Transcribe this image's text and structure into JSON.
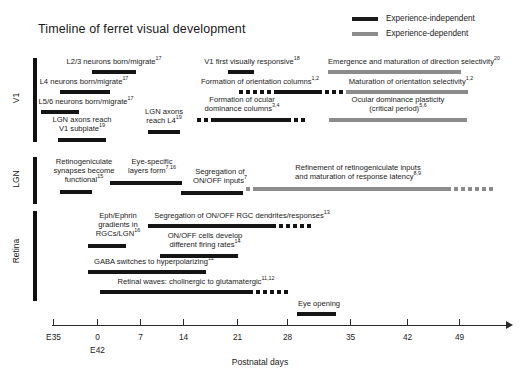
{
  "figure": {
    "title": "Timeline of ferret visual development",
    "axis_title": "Postnatal days",
    "colors": {
      "experience_independent": "#141414",
      "experience_dependent": "#8c8c8c",
      "axis": "#2b2b2b",
      "background": "#ffffff"
    }
  },
  "legend": {
    "items": [
      {
        "label": "Experience-independent",
        "color": "#141414",
        "style": "solid-black"
      },
      {
        "label": "Experience-dependent",
        "color": "#8c8c8c",
        "style": "solid-gray"
      }
    ]
  },
  "sections": [
    {
      "id": "v1",
      "label": "V1"
    },
    {
      "id": "lgn",
      "label": "LGN"
    },
    {
      "id": "retina",
      "label": "Retina"
    }
  ],
  "axis": {
    "ticks": [
      {
        "label": "E35",
        "sublabel": "",
        "x": 53
      },
      {
        "label": "0",
        "sublabel": "E42",
        "x": 97
      },
      {
        "label": "7",
        "sublabel": "",
        "x": 140
      },
      {
        "label": "14",
        "sublabel": "",
        "x": 183
      },
      {
        "label": "21",
        "sublabel": "",
        "x": 237
      },
      {
        "label": "28",
        "sublabel": "",
        "x": 287
      },
      {
        "label": "35",
        "sublabel": "",
        "x": 350
      },
      {
        "label": "42",
        "sublabel": "",
        "x": 407
      },
      {
        "label": "49",
        "sublabel": "",
        "x": 459
      }
    ]
  },
  "events": [
    {
      "section": "v1",
      "name": "l23-neurons-born-migrate",
      "label": "L2/3 neurons born/migrate",
      "ref": "17",
      "label_x": 54,
      "label_y": 58,
      "label_w": 120,
      "bar_x": 92,
      "bar_y": 70,
      "bar_w": 44,
      "type": "experience-independent",
      "dots_start": 0,
      "dots_end": 0
    },
    {
      "section": "v1",
      "name": "v1-first-visually-responsive",
      "label": "V1 first visually responsive",
      "ref": "18",
      "label_x": 190,
      "label_y": 58,
      "label_w": 124,
      "bar_x": 228,
      "bar_y": 70,
      "bar_w": 26,
      "type": "experience-independent",
      "dots_start": 0,
      "dots_end": 0
    },
    {
      "section": "v1",
      "name": "direction-selectivity",
      "label": "Emergence and maturation of direction selectivity",
      "ref": "20",
      "label_x": 308,
      "label_y": 58,
      "label_w": 212,
      "bar_x": 328,
      "bar_y": 70,
      "bar_w": 133,
      "type": "experience-dependent",
      "dots_start": 0,
      "dots_end": 0
    },
    {
      "section": "v1",
      "name": "l4-neurons-born-migrate",
      "label": "L4 neurons born/migrate",
      "ref": "17",
      "label_x": 28,
      "label_y": 78,
      "label_w": 112,
      "bar_x": 60,
      "bar_y": 90,
      "bar_w": 50,
      "type": "experience-independent",
      "dots_start": 0,
      "dots_end": 0
    },
    {
      "section": "v1",
      "name": "formation-orientation-columns",
      "label": "Formation of orientation columns",
      "ref": "1,2",
      "label_x": 190,
      "label_y": 78,
      "label_w": 140,
      "bar_x": 239,
      "bar_y": 90,
      "bar_w": 48,
      "type": "experience-independent",
      "dots_start": 5,
      "dots_end": 4
    },
    {
      "section": "v1",
      "name": "maturation-orientation-selectivity",
      "label": "Maturation of orientation selectivity",
      "ref": "1,2",
      "label_x": 332,
      "label_y": 78,
      "label_w": 158,
      "bar_x": 346,
      "bar_y": 90,
      "bar_w": 122,
      "type": "experience-dependent",
      "dots_start": 0,
      "dots_end": 0
    },
    {
      "section": "v1",
      "name": "l56-neurons-born-migrate",
      "label": "L5/6 neurons born/migrate",
      "ref": "17",
      "label_x": 26,
      "label_y": 98,
      "label_w": 120,
      "bar_x": 41,
      "bar_y": 110,
      "bar_w": 38,
      "type": "experience-independent",
      "dots_start": 0,
      "dots_end": 0
    },
    {
      "section": "v1",
      "name": "formation-ocular-dominance-columns",
      "label": "Formation of ocular",
      "label_line2": "dominance columns",
      "ref": "3,4",
      "label_x": 186,
      "label_y": 96,
      "label_w": 112,
      "bar_x": 197,
      "bar_y": 118,
      "bar_w": 80,
      "type": "experience-independent",
      "dots_start": 2,
      "dots_end": 2
    },
    {
      "section": "v1",
      "name": "ocular-dominance-plasticity",
      "label": "Ocular dominance plasticity",
      "label_line2": "(critical period)",
      "ref": "5,6",
      "label_x": 308,
      "label_y": 96,
      "label_w": 180,
      "bar_x": 329,
      "bar_y": 118,
      "bar_w": 138,
      "type": "experience-dependent",
      "dots_start": 0,
      "dots_end": 0
    },
    {
      "section": "v1",
      "name": "lgn-axons-reach-v1-subplate",
      "label": "LGN axons reach",
      "label_line2": "V1 subplate",
      "ref": "19",
      "label_x": 36,
      "label_y": 116,
      "label_w": 92,
      "bar_x": 58,
      "bar_y": 138,
      "bar_w": 48,
      "type": "experience-independent",
      "dots_start": 0,
      "dots_end": 0
    },
    {
      "section": "v1",
      "name": "lgn-axons-reach-l4",
      "label": "LGN axons",
      "label_line2": "reach L4",
      "ref": "19",
      "label_x": 134,
      "label_y": 108,
      "label_w": 60,
      "bar_x": 148,
      "bar_y": 130,
      "bar_w": 32,
      "type": "experience-independent",
      "dots_start": 0,
      "dots_end": 0
    },
    {
      "section": "lgn",
      "name": "retinogeniculate-synapses-functional",
      "label": "Retinogeniculate",
      "label_line2": "synapses become",
      "label_line3": "functional",
      "ref": "15",
      "label_x": 36,
      "label_y": 158,
      "label_w": 96,
      "bar_x": 60,
      "bar_y": 190,
      "bar_w": 32,
      "type": "experience-independent",
      "dots_start": 0,
      "dots_end": 0
    },
    {
      "section": "lgn",
      "name": "eye-specific-layers-form",
      "label": "Eye-specific",
      "label_line2": "layers form",
      "ref": "7,16",
      "label_x": 112,
      "label_y": 158,
      "label_w": 80,
      "bar_x": 110,
      "bar_y": 181,
      "bar_w": 72,
      "type": "experience-independent",
      "dots_start": 0,
      "dots_end": 0
    },
    {
      "section": "lgn",
      "name": "segregation-onoff-inputs",
      "label": "Segregation of",
      "label_line2": "ON/OFF inputs",
      "ref": "7",
      "label_x": 180,
      "label_y": 168,
      "label_w": 80,
      "bar_x": 181,
      "bar_y": 191,
      "bar_w": 62,
      "type": "experience-independent",
      "dots_start": 0,
      "dots_end": 0
    },
    {
      "section": "lgn",
      "name": "refinement-retinogeniculate-inputs",
      "label": "Refinement of retinogeniculate inputs",
      "label_line2": "and maturation of response latency",
      "ref": "8,9",
      "label_x": 270,
      "label_y": 164,
      "label_w": 176,
      "bar_x": 246,
      "bar_y": 187,
      "bar_w": 198,
      "type": "experience-dependent",
      "dots_start": 1,
      "dots_end": 6
    },
    {
      "section": "retina",
      "name": "eph-ephrin-gradients",
      "label": "Eph/Ephrin",
      "label_line2": "gradients in",
      "label_line3": "RGCs/LGN",
      "ref": "16",
      "label_x": 82,
      "label_y": 212,
      "label_w": 72,
      "bar_x": 88,
      "bar_y": 244,
      "bar_w": 38,
      "type": "experience-independent",
      "dots_start": 0,
      "dots_end": 0
    },
    {
      "section": "retina",
      "name": "segregation-onoff-rgc-dendrites",
      "label": "Segregation of ON/OFF RGC dendrites/responses",
      "ref": "13",
      "label_x": 138,
      "label_y": 212,
      "label_w": 208,
      "bar_x": 148,
      "bar_y": 224,
      "bar_w": 128,
      "type": "experience-independent",
      "dots_start": 0,
      "dots_end": 5
    },
    {
      "section": "retina",
      "name": "onoff-cells-firing-rates",
      "label": "ON/OFF cells develop",
      "label_line2": "different firing rates",
      "ref": "14",
      "label_x": 150,
      "label_y": 232,
      "label_w": 110,
      "bar_x": 160,
      "bar_y": 254,
      "bar_w": 78,
      "type": "experience-independent",
      "dots_start": 0,
      "dots_end": 0
    },
    {
      "section": "retina",
      "name": "gaba-switches-hyperpolarizing",
      "label": "GABA switches to hyperpolarizing",
      "ref": "12",
      "label_x": 78,
      "label_y": 258,
      "label_w": 152,
      "bar_x": 88,
      "bar_y": 270,
      "bar_w": 118,
      "type": "experience-independent",
      "dots_start": 0,
      "dots_end": 0
    },
    {
      "section": "retina",
      "name": "retinal-waves-cholinergic-glutamatergic",
      "label": "Retinal waves: cholinergic to glutamatergic",
      "ref": "11,12",
      "label_x": 100,
      "label_y": 278,
      "label_w": 192,
      "bar_x": 100,
      "bar_y": 290,
      "bar_w": 153,
      "type": "experience-independent",
      "dots_start": 0,
      "dots_end": 5
    },
    {
      "section": "axis",
      "name": "eye-opening",
      "label": "Eye opening",
      "ref": "",
      "label_x": 288,
      "label_y": 300,
      "label_w": 62,
      "bar_x": 297,
      "bar_y": 312,
      "bar_w": 39,
      "type": "experience-independent",
      "dots_start": 0,
      "dots_end": 0
    }
  ]
}
